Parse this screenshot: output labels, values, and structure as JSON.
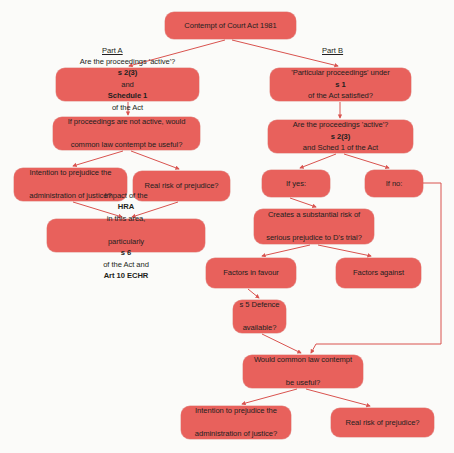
{
  "diagram": {
    "background_color": "#fbfbf9",
    "node_color": "#e8615c",
    "connector_color": "#d9534f",
    "text_color": "#231f20",
    "labels": {
      "part_a": "Part A",
      "part_b": "Part B"
    },
    "nodes": [
      {
        "id": "root",
        "text": "Contempt of Court Act 1981",
        "x": 165,
        "y": 12,
        "w": 131,
        "h": 27
      },
      {
        "id": "a1",
        "text": "Are the proceedings 'active'? s 2(3) and Schedule 1 of the Act",
        "line1": "Are the proceedings 'active'? ",
        "line1_bold": "s 2(3)",
        "line2_pre": "and ",
        "line2_bold": "Schedule 1",
        "line2_post": " of the Act",
        "x": 56,
        "y": 68,
        "w": 143,
        "h": 33
      },
      {
        "id": "b1",
        "text": "'Particular proceedings' under s 1 of the Act satisfied?",
        "line1": "'Particular proceedings' under ",
        "line1_bold": "s 1",
        "line2": "of the Act satisfied?",
        "x": 270,
        "y": 68,
        "w": 141,
        "h": 33
      },
      {
        "id": "a2",
        "text": "If proceedings are not active, would common law contempt be useful?",
        "line1": "If proceedings are not active, would",
        "line2": "common law contempt be useful?",
        "x": 53,
        "y": 117,
        "w": 147,
        "h": 33
      },
      {
        "id": "b2",
        "text": "Are the proceedings 'active'? s 2(3) and Sched 1 of the Act",
        "line1": "Are the proceedings 'active'? ",
        "line1_bold": "s 2(3)",
        "line2": "and Sched 1 of the Act",
        "x": 268,
        "y": 120,
        "w": 145,
        "h": 33
      },
      {
        "id": "a3",
        "text": "Intention to prejudice the administration of justice?",
        "line1": "Intention to prejudice the",
        "line2": "administration of justice?",
        "x": 14,
        "y": 168,
        "w": 113,
        "h": 33
      },
      {
        "id": "a4",
        "text": "Real risk of prejudice?",
        "x": 133,
        "y": 171,
        "w": 97,
        "h": 30
      },
      {
        "id": "b3",
        "text": "If yes:",
        "x": 262,
        "y": 170,
        "w": 68,
        "h": 27
      },
      {
        "id": "b4",
        "text": "If no:",
        "x": 365,
        "y": 170,
        "w": 58,
        "h": 27
      },
      {
        "id": "a5",
        "text": "Impact of the HRA in this area, particularly s 6 of the Act and Art 10 ECHR",
        "line1_pre": "Impact of the ",
        "line1_bold": "HRA",
        "line1_post": " in this area,",
        "line2_pre": "particularly ",
        "line2_bold1": "s 6",
        "line2_mid": " of the Act and ",
        "line2_bold2": "Art 10 ECHR",
        "x": 47,
        "y": 219,
        "w": 158,
        "h": 33
      },
      {
        "id": "b5",
        "text": "Creates a substantial risk of serious prejudice to D's trial?",
        "line1": "Creates a substantial risk of",
        "line2": "serious prejudice to D's trial?",
        "x": 254,
        "y": 209,
        "w": 120,
        "h": 35
      },
      {
        "id": "b6",
        "text": "Factors in favour",
        "x": 206,
        "y": 258,
        "w": 90,
        "h": 30
      },
      {
        "id": "b7",
        "text": "Factors against",
        "x": 336,
        "y": 258,
        "w": 85,
        "h": 30
      },
      {
        "id": "b8",
        "text": "s 5 Defence available?",
        "line1": "s 5 Defence",
        "line2": "available?",
        "x": 233,
        "y": 300,
        "w": 53,
        "h": 33
      },
      {
        "id": "b9",
        "text": "Would common law contempt be useful?",
        "line1": "Would common law contempt",
        "line2": "be useful?",
        "x": 243,
        "y": 355,
        "w": 120,
        "h": 33
      },
      {
        "id": "c1",
        "text": "Intention to prejudice the administration of justice?",
        "line1": "Intention to prejudice the",
        "line2": "administration of justice?",
        "x": 181,
        "y": 406,
        "w": 110,
        "h": 33
      },
      {
        "id": "c2",
        "text": "Real risk of prejudice?",
        "x": 331,
        "y": 408,
        "w": 103,
        "h": 29
      }
    ],
    "connectors": [
      {
        "from": "root",
        "to": "a1"
      },
      {
        "from": "root",
        "to": "b1"
      },
      {
        "from": "a1",
        "to": "a2"
      },
      {
        "from": "a2",
        "to": "a3"
      },
      {
        "from": "a2",
        "to": "a4"
      },
      {
        "from": "a3",
        "to": "a5"
      },
      {
        "from": "a4",
        "to": "a5"
      },
      {
        "from": "b1",
        "to": "b2"
      },
      {
        "from": "b2",
        "to": "b3"
      },
      {
        "from": "b2",
        "to": "b4"
      },
      {
        "from": "b3",
        "to": "b5"
      },
      {
        "from": "b5",
        "to": "b6"
      },
      {
        "from": "b5",
        "to": "b7"
      },
      {
        "from": "b6",
        "to": "b8"
      },
      {
        "from": "b8",
        "to": "b9"
      },
      {
        "from": "b4",
        "to": "b9"
      },
      {
        "from": "b9",
        "to": "c1"
      },
      {
        "from": "b9",
        "to": "c2"
      }
    ]
  }
}
